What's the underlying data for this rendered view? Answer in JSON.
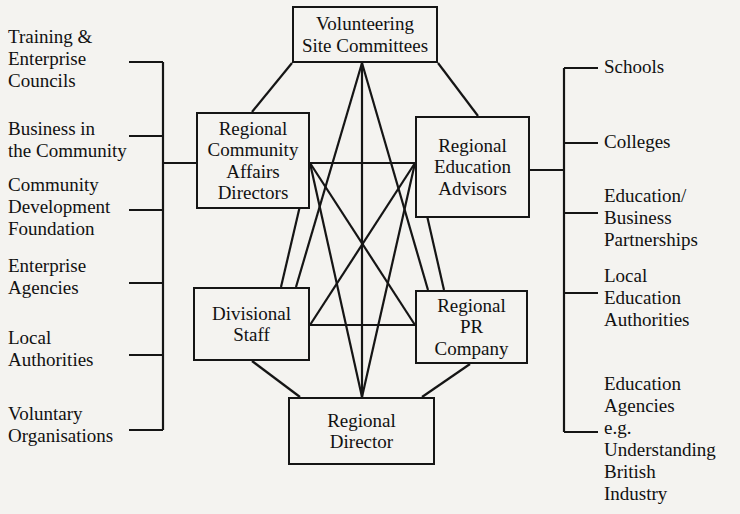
{
  "diagram": {
    "style": {
      "background": "#f4f3f0",
      "line_color": "#151515",
      "text_color": "#111111"
    },
    "nodes": [
      {
        "id": "volunteering",
        "label": "Volunteering\nSite Committees",
        "x": 292,
        "y": 6,
        "w": 146,
        "h": 57
      },
      {
        "id": "rcad",
        "label": "Regional\nCommunity\nAffairs\nDirectors",
        "x": 196,
        "y": 112,
        "w": 114,
        "h": 97
      },
      {
        "id": "rea",
        "label": "Regional\nEducation\nAdvisors",
        "x": 415,
        "y": 116,
        "w": 115,
        "h": 102
      },
      {
        "id": "divisional",
        "label": "Divisional\nStaff",
        "x": 193,
        "y": 287,
        "w": 117,
        "h": 74
      },
      {
        "id": "pr",
        "label": "Regional\nPR Company",
        "x": 415,
        "y": 290,
        "w": 113,
        "h": 74
      },
      {
        "id": "director",
        "label": "Regional\nDirector",
        "x": 288,
        "y": 397,
        "w": 147,
        "h": 68
      }
    ],
    "left_bracket": {
      "labels": [
        {
          "id": "tec",
          "text": "Training &\nEnterprise\nCouncils",
          "x": 8,
          "y": 26
        },
        {
          "id": "bitc",
          "text": "Business in\nthe Community",
          "x": 8,
          "y": 118
        },
        {
          "id": "cdf",
          "text": "Community\nDevelopment\nFoundation",
          "x": 8,
          "y": 174
        },
        {
          "id": "ea",
          "text": "Enterprise\nAgencies",
          "x": 8,
          "y": 255
        },
        {
          "id": "la",
          "text": "Local\nAuthorities",
          "x": 8,
          "y": 327
        },
        {
          "id": "vo",
          "text": "Voluntary\nOrganisations",
          "x": 8,
          "y": 403
        }
      ]
    },
    "right_bracket": {
      "labels": [
        {
          "id": "schools",
          "text": "Schools",
          "x": 604,
          "y": 56
        },
        {
          "id": "colleges",
          "text": "Colleges",
          "x": 604,
          "y": 131
        },
        {
          "id": "ebp",
          "text": "Education/\nBusiness\nPartnerships",
          "x": 604,
          "y": 185
        },
        {
          "id": "lea",
          "text": "Local\nEducation\nAuthorities",
          "x": 604,
          "y": 265
        },
        {
          "id": "eduagencies",
          "text": "Education\nAgencies\ne.g.\nUnderstanding\nBritish\nIndustry",
          "x": 604,
          "y": 373
        }
      ]
    },
    "connections": [
      {
        "from": "rcad",
        "to": "volunteering"
      },
      {
        "from": "rea",
        "to": "volunteering"
      },
      {
        "from": "rcad",
        "to": "rea"
      },
      {
        "from": "rcad",
        "to": "divisional"
      },
      {
        "from": "rcad",
        "to": "pr"
      },
      {
        "from": "rea",
        "to": "divisional"
      },
      {
        "from": "rea",
        "to": "pr"
      },
      {
        "from": "divisional",
        "to": "pr"
      },
      {
        "from": "divisional",
        "to": "director"
      },
      {
        "from": "pr",
        "to": "director"
      },
      {
        "from": "volunteering",
        "to": "divisional"
      },
      {
        "from": "volunteering",
        "to": "pr"
      },
      {
        "from": "volunteering",
        "to": "director"
      },
      {
        "from": "rcad",
        "to": "director"
      },
      {
        "from": "rea",
        "to": "director"
      },
      {
        "from": "left_bracket",
        "to": "rcad"
      },
      {
        "from": "right_bracket",
        "to": "rea"
      }
    ]
  }
}
